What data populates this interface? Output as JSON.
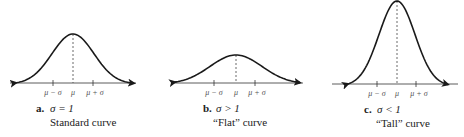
{
  "panels": [
    {
      "id": "a",
      "letter": "a.",
      "condition": "σ = 1",
      "name": "Standard curve",
      "sigma_relative": 1.0,
      "ticks": [
        "μ − σ",
        "μ",
        "μ + σ"
      ]
    },
    {
      "id": "b",
      "letter": "b.",
      "condition": "σ > 1",
      "name": "“Flat” curve",
      "sigma_relative": 1.0,
      "ticks": [
        "μ − σ",
        "μ",
        "μ + σ"
      ]
    },
    {
      "id": "c",
      "letter": "c.",
      "condition": "σ < 1",
      "name": "“Tall” curve",
      "sigma_relative": 1.0,
      "ticks": [
        "μ − σ",
        "μ",
        "μ + σ"
      ]
    }
  ],
  "colors": {
    "curve": "#1a1a1a",
    "axis": "#333333",
    "dash": "#444444"
  }
}
